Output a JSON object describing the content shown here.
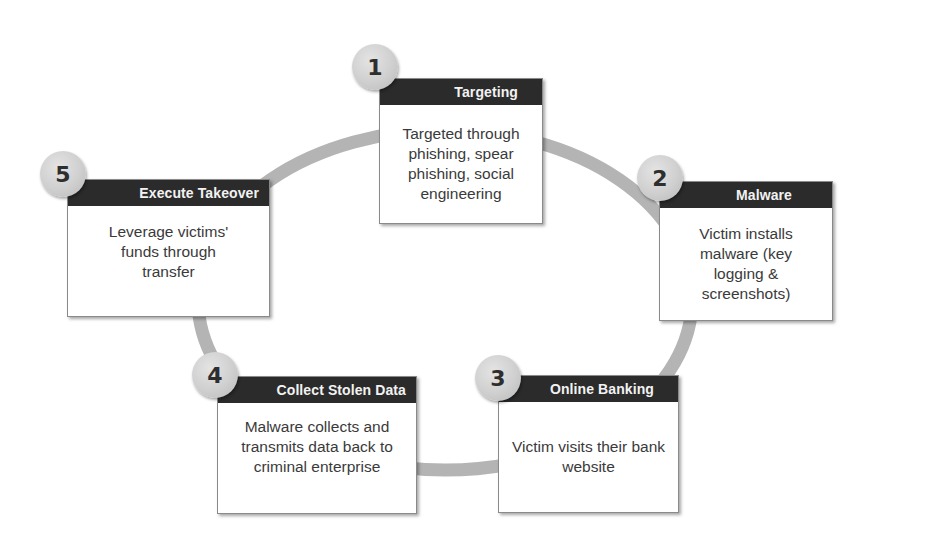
{
  "diagram": {
    "type": "cycle",
    "colors": {
      "ring": "#b4b4b4",
      "header_bg": "#2b2b2b",
      "header_text": "#f2f2f2",
      "body_text": "#3a3a3a",
      "badge": "#cfcfcf"
    },
    "steps": [
      {
        "number": "1",
        "title": "Targeting",
        "text": "Targeted through phishing, spear phishing, social engineering"
      },
      {
        "number": "2",
        "title": "Malware",
        "text": "Victim installs malware (key logging & screenshots)"
      },
      {
        "number": "3",
        "title": "Online Banking",
        "text": "Victim visits their bank website"
      },
      {
        "number": "4",
        "title": "Collect Stolen Data",
        "text": "Malware collects and transmits data back to criminal enterprise"
      },
      {
        "number": "5",
        "title": "Execute Takeover",
        "text": "Leverage victims' funds through transfer"
      }
    ]
  }
}
